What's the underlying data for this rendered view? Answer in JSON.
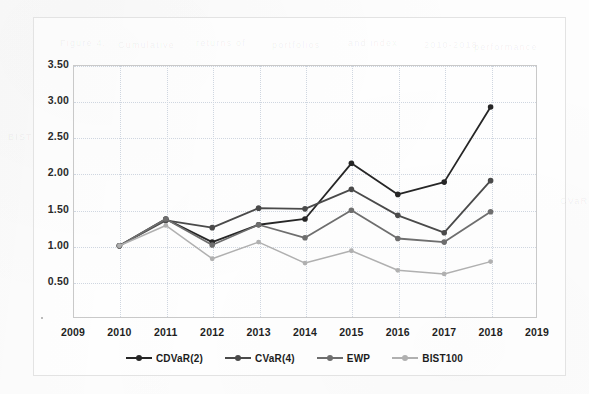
{
  "figure": {
    "background_color": "#fdfdfd",
    "frame_border_color": "#e3e3e3",
    "plot_border_color": "#c9c9c9",
    "gridline_color": "#cfd6e0"
  },
  "ghost_text": [
    {
      "text": "Figure 4.",
      "x": 60,
      "y": 38
    },
    {
      "text": "Cumulative",
      "x": 118,
      "y": 40
    },
    {
      "text": "returns of",
      "x": 196,
      "y": 38
    },
    {
      "text": "portfolios",
      "x": 272,
      "y": 40
    },
    {
      "text": "and index",
      "x": 348,
      "y": 38
    },
    {
      "text": "2010-2018",
      "x": 424,
      "y": 40
    },
    {
      "text": "performance",
      "x": 474,
      "y": 42
    },
    {
      "text": "BIST",
      "x": 8,
      "y": 132
    },
    {
      "text": "CVaR",
      "x": 560,
      "y": 196
    }
  ],
  "legend": {
    "position": "bottom-center",
    "items": [
      {
        "label": "CDVaR(2)",
        "color": "#262626"
      },
      {
        "label": "CVaR(4)",
        "color": "#4a4a4a"
      },
      {
        "label": "EWP",
        "color": "#6e6e6e"
      },
      {
        "label": "BIST100",
        "color": "#b0b0b0"
      }
    ]
  },
  "chart_data": {
    "type": "line",
    "title": "",
    "subtitle": "",
    "xlabel": "",
    "ylabel": "",
    "x": [
      2010,
      2011,
      2012,
      2013,
      2014,
      2015,
      2016,
      2017,
      2018
    ],
    "categories": [
      "2010",
      "2011",
      "2012",
      "2013",
      "2014",
      "2015",
      "2016",
      "2017",
      "2018"
    ],
    "xlim": [
      2009,
      2019
    ],
    "ylim": [
      0.0,
      3.5
    ],
    "xticks": [
      2009,
      2010,
      2011,
      2012,
      2013,
      2014,
      2015,
      2016,
      2017,
      2018,
      2019
    ],
    "xtick_labels": [
      "2009",
      "2010",
      "2011",
      "2012",
      "2013",
      "2014",
      "2015",
      "2016",
      "2017",
      "2018",
      "2019"
    ],
    "yticks": [
      0.5,
      1.0,
      1.5,
      2.0,
      2.5,
      3.0,
      3.5
    ],
    "ytick_labels": [
      "0.50",
      "1.00",
      "1.50",
      "2.00",
      "2.50",
      "3.00",
      "3.50"
    ],
    "grid": true,
    "grid_axis": "both",
    "legend_position": "bottom",
    "marker": "circle",
    "series": [
      {
        "name": "CDVaR(2)",
        "color": "#262626",
        "values": [
          1.0,
          1.37,
          1.05,
          1.29,
          1.37,
          2.14,
          1.71,
          1.88,
          2.92
        ]
      },
      {
        "name": "CVaR(4)",
        "color": "#4a4a4a",
        "values": [
          1.0,
          1.35,
          1.25,
          1.52,
          1.51,
          1.78,
          1.42,
          1.18,
          1.9
        ]
      },
      {
        "name": "EWP",
        "color": "#6e6e6e",
        "values": [
          1.0,
          1.37,
          1.01,
          1.29,
          1.11,
          1.49,
          1.1,
          1.05,
          1.47
        ]
      },
      {
        "name": "BIST100",
        "color": "#b0b0b0",
        "values": [
          1.0,
          1.28,
          0.82,
          1.05,
          0.76,
          0.93,
          0.66,
          0.61,
          0.78
        ]
      }
    ]
  }
}
